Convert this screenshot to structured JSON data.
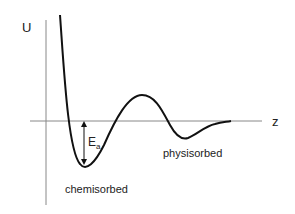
{
  "diagram": {
    "y_axis_label": "U",
    "x_axis_label": "z",
    "activation_label": "E",
    "activation_subscript": "a",
    "chemisorbed_label": "chemisorbed",
    "physisorbed_label": "physisorbed",
    "colors": {
      "axis": "#888888",
      "curve": "#111111",
      "text": "#222222"
    }
  }
}
